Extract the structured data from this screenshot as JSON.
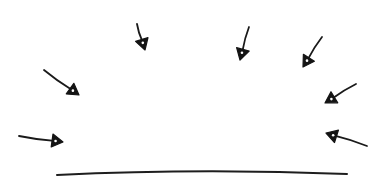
{
  "diagram": {
    "colors": {
      "background": "#ffffff",
      "ink": "#1a1a1a"
    },
    "surface": {
      "start": [
        57,
        175
      ],
      "control": [
        200,
        168
      ],
      "end": [
        347,
        174
      ]
    },
    "arrows": [
      {
        "id": "arrow-top-left",
        "tail": [
          137,
          24
        ],
        "head": [
          145,
          50
        ]
      },
      {
        "id": "arrow-mid-left",
        "tail": [
          44,
          70
        ],
        "head": [
          79,
          95
        ]
      },
      {
        "id": "arrow-low-left",
        "tail": [
          19,
          136
        ],
        "head": [
          63,
          142
        ]
      },
      {
        "id": "arrow-top-center",
        "tail": [
          249,
          27
        ],
        "head": [
          240,
          60
        ]
      },
      {
        "id": "arrow-top-right",
        "tail": [
          322,
          37
        ],
        "head": [
          303,
          67
        ]
      },
      {
        "id": "arrow-mid-right",
        "tail": [
          356,
          84
        ],
        "head": [
          325,
          103
        ]
      },
      {
        "id": "arrow-low-right",
        "tail": [
          367,
          146
        ],
        "head": [
          326,
          133
        ]
      }
    ]
  }
}
